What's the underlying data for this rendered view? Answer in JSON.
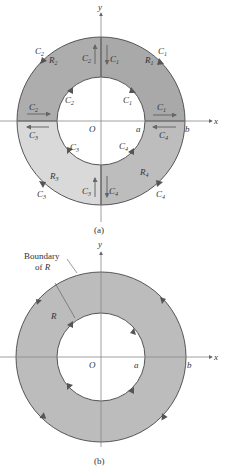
{
  "figure_a": {
    "caption": "(a)",
    "axes": {
      "x_label": "x",
      "y_label": "y",
      "origin_label": "O",
      "inner_radius_label": "a",
      "outer_radius_label": "b"
    },
    "regions": [
      {
        "label": "R",
        "sub": "1",
        "quadrant": 1,
        "fill": "#a9a9a9"
      },
      {
        "label": "R",
        "sub": "2",
        "quadrant": 2,
        "fill": "#adadad"
      },
      {
        "label": "R",
        "sub": "3",
        "quadrant": 3,
        "fill": "#d9d9d9"
      },
      {
        "label": "R",
        "sub": "4",
        "quadrant": 4,
        "fill": "#bdbdbd"
      }
    ],
    "curve_labels": {
      "c1": "C",
      "c1_sub": "1",
      "c2": "C",
      "c2_sub": "2",
      "c3": "C",
      "c3_sub": "3",
      "c4": "C",
      "c4_sub": "4"
    }
  },
  "figure_b": {
    "caption": "(b)",
    "axes": {
      "x_label": "x",
      "y_label": "y",
      "origin_label": "O",
      "inner_radius_label": "a",
      "outer_radius_label": "b"
    },
    "region_label": "R",
    "region_fill": "#bcbcbc",
    "annotation_line1": "Boundary",
    "annotation_line2": "of",
    "annotation_line2_var": "R"
  },
  "colors": {
    "stroke": "#555555",
    "arrow": "#666666",
    "axis": "#888888"
  }
}
